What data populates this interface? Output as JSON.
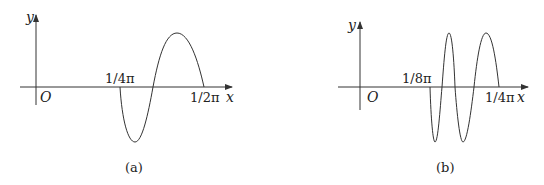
{
  "panels": [
    {
      "id": "a",
      "caption": "(a)",
      "y_label": "y",
      "x_label": "x",
      "origin_label": "O",
      "tick_start": "1/4π",
      "tick_end": "1/2π",
      "description": "One full sine-like period starting at 1/4π (dipping negative first) and ending at 1/2π"
    },
    {
      "id": "b",
      "caption": "(b)",
      "y_label": "y",
      "x_label": "x",
      "origin_label": "O",
      "tick_start": "1/8π",
      "tick_end": "1/4π",
      "description": "Two full periods starting at 1/8π (dipping negative first) and ending at 1/4π"
    }
  ],
  "colors": {
    "stroke": "#333333",
    "text": "#222222"
  }
}
